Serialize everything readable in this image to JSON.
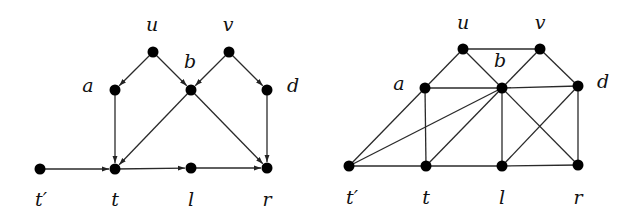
{
  "figure": {
    "left_graph": {
      "directed": true,
      "nodes": [
        {
          "id": "u",
          "label": "u",
          "x": 153,
          "y": 52,
          "lx": 152,
          "ly": 31
        },
        {
          "id": "v",
          "label": "v",
          "x": 229,
          "y": 52,
          "lx": 228,
          "ly": 31
        },
        {
          "id": "a",
          "label": "a",
          "x": 115,
          "y": 90,
          "lx": 88,
          "ly": 92
        },
        {
          "id": "b",
          "label": "b",
          "x": 191,
          "y": 90,
          "lx": 190,
          "ly": 68
        },
        {
          "id": "d",
          "label": "d",
          "x": 267,
          "y": 90,
          "lx": 293,
          "ly": 92
        },
        {
          "id": "tp",
          "label": "t′",
          "x": 40,
          "y": 169,
          "lx": 41,
          "ly": 206
        },
        {
          "id": "t",
          "label": "t",
          "x": 115,
          "y": 169,
          "lx": 115,
          "ly": 206
        },
        {
          "id": "l",
          "label": "l",
          "x": 191,
          "y": 168,
          "lx": 191,
          "ly": 206
        },
        {
          "id": "r",
          "label": "r",
          "x": 267,
          "y": 168,
          "lx": 267,
          "ly": 206
        }
      ],
      "edges": [
        [
          "u",
          "a"
        ],
        [
          "u",
          "b"
        ],
        [
          "v",
          "b"
        ],
        [
          "v",
          "d"
        ],
        [
          "a",
          "t"
        ],
        [
          "b",
          "t"
        ],
        [
          "b",
          "r"
        ],
        [
          "d",
          "r"
        ],
        [
          "tp",
          "t"
        ],
        [
          "t",
          "l"
        ],
        [
          "l",
          "r"
        ]
      ]
    },
    "right_graph": {
      "directed": false,
      "nodes": [
        {
          "id": "u",
          "label": "u",
          "x": 463,
          "y": 49,
          "lx": 463,
          "ly": 29
        },
        {
          "id": "v",
          "label": "v",
          "x": 540,
          "y": 49,
          "lx": 540,
          "ly": 29
        },
        {
          "id": "a",
          "label": "a",
          "x": 425,
          "y": 88,
          "lx": 399,
          "ly": 90
        },
        {
          "id": "b",
          "label": "b",
          "x": 502,
          "y": 88,
          "lx": 500,
          "ly": 67
        },
        {
          "id": "d",
          "label": "d",
          "x": 578,
          "y": 86,
          "lx": 603,
          "ly": 88
        },
        {
          "id": "tp",
          "label": "t′",
          "x": 349,
          "y": 166,
          "lx": 352,
          "ly": 204
        },
        {
          "id": "t",
          "label": "t",
          "x": 426,
          "y": 166,
          "lx": 426,
          "ly": 204
        },
        {
          "id": "l",
          "label": "l",
          "x": 502,
          "y": 166,
          "lx": 502,
          "ly": 204
        },
        {
          "id": "r",
          "label": "r",
          "x": 578,
          "y": 165,
          "lx": 578,
          "ly": 204
        }
      ],
      "edges": [
        [
          "u",
          "v"
        ],
        [
          "u",
          "a"
        ],
        [
          "u",
          "b"
        ],
        [
          "v",
          "b"
        ],
        [
          "v",
          "d"
        ],
        [
          "a",
          "b"
        ],
        [
          "b",
          "d"
        ],
        [
          "a",
          "tp"
        ],
        [
          "a",
          "t"
        ],
        [
          "b",
          "tp"
        ],
        [
          "b",
          "t"
        ],
        [
          "b",
          "l"
        ],
        [
          "b",
          "r"
        ],
        [
          "d",
          "l"
        ],
        [
          "d",
          "r"
        ],
        [
          "tp",
          "t"
        ],
        [
          "t",
          "l"
        ],
        [
          "l",
          "r"
        ]
      ]
    },
    "style": {
      "node_radius": 5.5,
      "node_color": "#000000",
      "edge_color": "#2a2a2a",
      "background": "#ffffff"
    }
  }
}
